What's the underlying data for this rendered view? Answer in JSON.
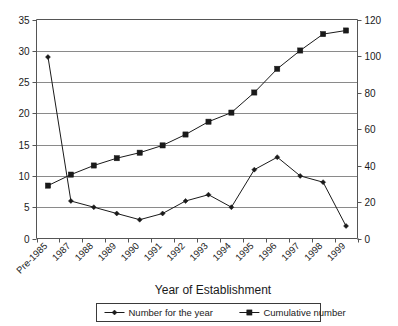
{
  "chart_data": {
    "type": "line",
    "title": "",
    "xlabel": "Year of Establishment",
    "ylabel": "",
    "ylabel_right": "",
    "categories": [
      "Pre-1985",
      "1987",
      "1988",
      "1989",
      "1990",
      "1991",
      "1992",
      "1993",
      "1994",
      "1995",
      "1996",
      "1997",
      "1998",
      "1999"
    ],
    "series": [
      {
        "name": "Number for the year",
        "axis": "left",
        "marker": "diamond",
        "values": [
          29,
          6,
          5,
          4,
          3,
          4,
          6,
          7,
          5,
          11,
          13,
          10,
          9,
          2
        ]
      },
      {
        "name": "Cumulative number",
        "axis": "right",
        "marker": "square",
        "values": [
          29,
          35,
          40,
          44,
          47,
          51,
          57,
          64,
          69,
          80,
          93,
          103,
          112,
          114
        ]
      }
    ],
    "ylim": [
      0,
      35
    ],
    "ylim_right": [
      0,
      120
    ],
    "yticks": [
      0,
      5,
      10,
      15,
      20,
      25,
      30,
      35
    ],
    "yticks_right": [
      0,
      20,
      40,
      60,
      80,
      100,
      120
    ],
    "grid": true,
    "legend_position": "bottom",
    "colors": {
      "series": "#1a1a1a",
      "grid": "#8a8a8a",
      "axis": "#555555"
    }
  },
  "legend": {
    "items": [
      {
        "label": "Number for the year"
      },
      {
        "label": "Cumulative number"
      }
    ]
  },
  "axes": {
    "x_title": "Year of Establishment"
  }
}
